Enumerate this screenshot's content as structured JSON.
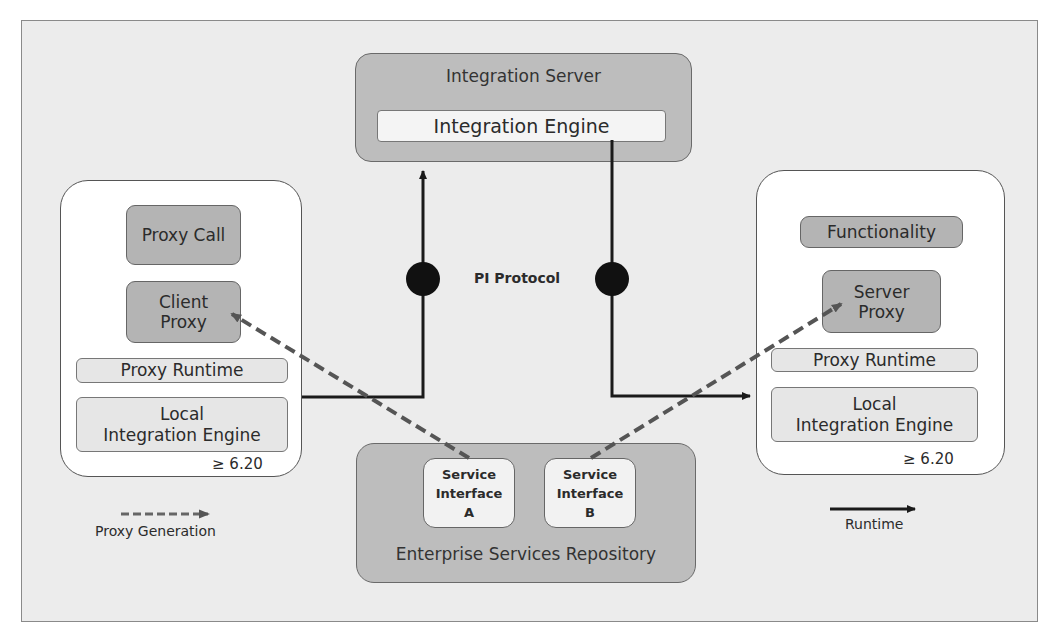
{
  "diagram": {
    "integration_server": {
      "title": "Integration Server",
      "engine": "Integration Engine"
    },
    "protocol_label": "PI Protocol",
    "client_system": {
      "proxy_call": "Proxy Call",
      "client_proxy_line1": "Client",
      "client_proxy_line2": "Proxy",
      "proxy_runtime": "Proxy Runtime",
      "local_engine_line1": "Local",
      "local_engine_line2": "Integration Engine",
      "version": "≥ 6.20"
    },
    "server_system": {
      "functionality": "Functionality",
      "server_proxy_line1": "Server",
      "server_proxy_line2": "Proxy",
      "proxy_runtime": "Proxy Runtime",
      "local_engine_line1": "Local",
      "local_engine_line2": "Integration Engine",
      "version": "≥ 6.20"
    },
    "repository": {
      "title": "Enterprise Services Repository",
      "interfaces": [
        {
          "line1": "Service",
          "line2": "Interface",
          "line3": "A"
        },
        {
          "line1": "Service",
          "line2": "Interface",
          "line3": "B"
        }
      ]
    },
    "legend": {
      "proxy_generation": "Proxy Generation",
      "runtime": "Runtime"
    },
    "colors": {
      "background": "#ececec",
      "dark_box": "#b4b4b4",
      "container_gray": "#bdbdbd",
      "light_box": "#e6e6e6",
      "dashed_arrow": "#555555",
      "runtime_arrow": "#1a1a1a"
    }
  }
}
